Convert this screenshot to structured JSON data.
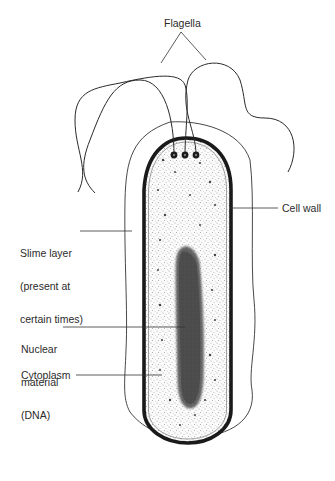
{
  "diagram": {
    "labels": {
      "flagella": "Flagella",
      "cell_wall": "Cell wall",
      "slime_layer": [
        "Slime layer",
        "(present at",
        "certain times)"
      ],
      "nuclear_material": [
        "Nuclear",
        "material",
        "(DNA)"
      ],
      "cytoplasm": "Cytoplasm"
    },
    "colors": {
      "ink": "#2a2a2a",
      "background": "#ffffff",
      "stipple": "#555555"
    },
    "basal_bodies_count": 3
  }
}
